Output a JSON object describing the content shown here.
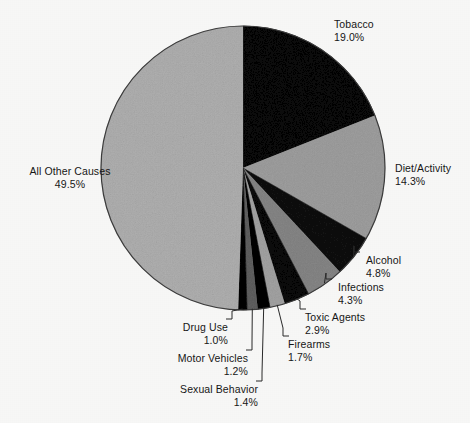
{
  "chart_data": {
    "type": "pie",
    "title": "",
    "subtitle": "",
    "xlabel": "",
    "ylabel": "",
    "legend_position": "callout-labels",
    "grid": false,
    "units": "percent",
    "start_angle_deg": 0,
    "direction": "clockwise",
    "categories": [
      "Tobacco",
      "Diet/Activity",
      "Alcohol",
      "Infections",
      "Toxic Agents",
      "Firearms",
      "Sexual Behavior",
      "Motor Vehicles",
      "Drug Use",
      "All Other Causes"
    ],
    "values": [
      19.0,
      14.3,
      4.8,
      4.3,
      2.9,
      1.7,
      1.4,
      1.2,
      1.0,
      49.5
    ],
    "value_labels": [
      "19.0%",
      "14.3%",
      "4.8%",
      "4.3%",
      "2.9%",
      "1.7%",
      "1.4%",
      "1.2%",
      "1.0%",
      "49.5%"
    ],
    "slice_colors": [
      "#2b2b2b",
      "#c9c9c9",
      "#3a3a3a",
      "#b8b8b8",
      "#2e2e2e",
      "#cccccc",
      "#141414",
      "#9a9a9a",
      "#111111",
      "#d4d4d4"
    ]
  },
  "slices": [
    {
      "name": "Tobacco",
      "percent_label": "19.0%",
      "label_align": "left",
      "label_x": 334,
      "label_y": 18,
      "has_leader": false
    },
    {
      "name": "Diet/Activity",
      "percent_label": "14.3%",
      "label_align": "left",
      "label_x": 395,
      "label_y": 162,
      "has_leader": false
    },
    {
      "name": "Alcohol",
      "percent_label": "4.8%",
      "label_align": "left",
      "label_x": 366,
      "label_y": 254,
      "has_leader": true
    },
    {
      "name": "Infections",
      "percent_label": "4.3%",
      "label_align": "left",
      "label_x": 338,
      "label_y": 281,
      "has_leader": true
    },
    {
      "name": "Toxic Agents",
      "percent_label": "2.9%",
      "label_align": "left",
      "label_x": 305,
      "label_y": 311,
      "has_leader": true
    },
    {
      "name": "Firearms",
      "percent_label": "1.7%",
      "label_align": "left",
      "label_x": 288,
      "label_y": 338,
      "has_leader": true
    },
    {
      "name": "Sexual Behavior",
      "percent_label": "1.4%",
      "label_align": "right",
      "label_x": 258,
      "label_y": 383,
      "has_leader": true
    },
    {
      "name": "Motor Vehicles",
      "percent_label": "1.2%",
      "label_align": "right",
      "label_x": 248,
      "label_y": 352,
      "has_leader": true
    },
    {
      "name": "Drug Use",
      "percent_label": "1.0%",
      "label_align": "right",
      "label_x": 228,
      "label_y": 321,
      "has_leader": true
    },
    {
      "name": "All Other Causes",
      "percent_label": "49.5%",
      "label_align": "center",
      "label_x": 10,
      "label_y": 165,
      "has_leader": false
    }
  ],
  "colors": {
    "background": "#fbfbfa",
    "text": "#171717",
    "outline": "#3d3d3d",
    "leader_line": "#2a2a2a"
  },
  "geometry": {
    "center_x": 243,
    "center_y": 168,
    "radius": 142
  }
}
